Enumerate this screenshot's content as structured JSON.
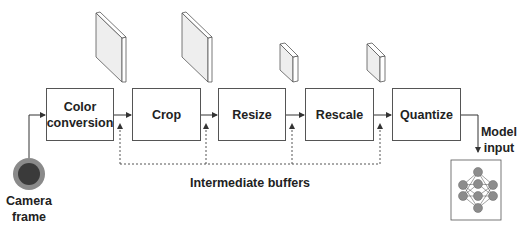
{
  "diagram": {
    "stages": [
      {
        "id": "color-conversion",
        "label": "Color\nconversion"
      },
      {
        "id": "crop",
        "label": "Crop"
      },
      {
        "id": "resize",
        "label": "Resize"
      },
      {
        "id": "rescale",
        "label": "Rescale"
      },
      {
        "id": "quantize",
        "label": "Quantize"
      }
    ],
    "source": {
      "label": "Camera frame",
      "line1": "Camera",
      "line2": "frame",
      "icon": "camera-lens-icon"
    },
    "sink": {
      "label": "Model input",
      "line1": "Model",
      "line2": "input",
      "icon": "neural-network-icon"
    },
    "buffers_label": "Intermediate buffers",
    "buffers": [
      {
        "after": "color-conversion",
        "size": "large"
      },
      {
        "after": "crop",
        "size": "large"
      },
      {
        "after": "resize",
        "size": "small"
      },
      {
        "after": "rescale",
        "size": "small"
      }
    ],
    "colors": {
      "stroke": "#555555",
      "slab_fill": "#eeeeee",
      "lens_outer": "#8a8a8a",
      "lens_inner": "#3a3a3a",
      "node_fill": "#8c8c8c"
    }
  }
}
